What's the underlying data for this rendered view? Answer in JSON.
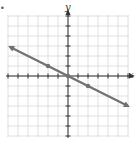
{
  "figure": {
    "marker": "•",
    "x_axis_label": "x",
    "y_axis_label": "y",
    "colors": {
      "grid": "#d8d8d8",
      "axis": "#333333",
      "line": "#707070",
      "background": "#ffffff"
    }
  },
  "chart_data": {
    "type": "line",
    "title": "",
    "xlabel": "x",
    "ylabel": "y",
    "xlim": [
      -6,
      6
    ],
    "ylim": [
      -6,
      6
    ],
    "grid": true,
    "tick_spacing": 1,
    "line": {
      "equation": "y = -x/2",
      "slope": -0.5,
      "intercept": 0,
      "arrows_both_ends": true,
      "x_range": [
        -5.8,
        6
      ]
    },
    "points": [
      {
        "x": -2,
        "y": 1
      },
      {
        "x": 0,
        "y": 0
      },
      {
        "x": 2,
        "y": -1
      }
    ]
  }
}
